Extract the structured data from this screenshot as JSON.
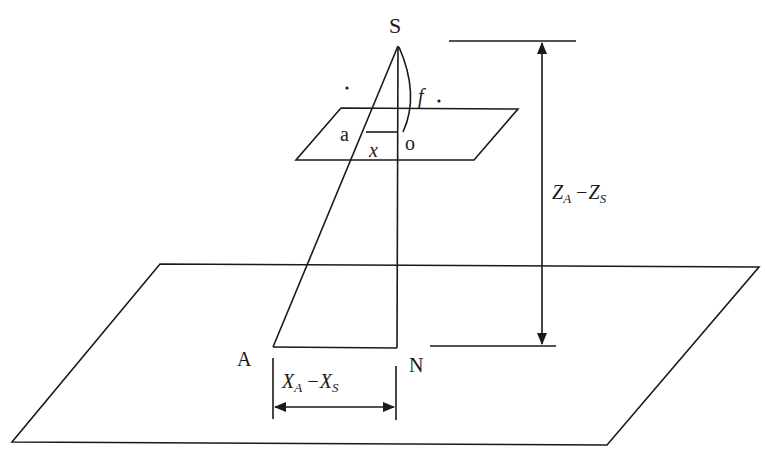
{
  "diagram": {
    "type": "photogrammetry-collinearity",
    "labels": {
      "perspective_center": "S",
      "image_point": "a",
      "principal_point": "o",
      "image_coord": "x",
      "focal_length": "f",
      "ground_point": "A",
      "nadir_point": "N",
      "height_main": "Z",
      "height_sub1": "A",
      "height_minus": "−",
      "height_sub2": "S",
      "width_main": "X",
      "width_sub1": "A",
      "width_minus": "−",
      "width_sub2": "S"
    },
    "dimensions": {
      "vertical": "Z_A − Z_S",
      "horizontal": "X_A − X_S"
    },
    "colors": {
      "stroke": "#1a1a1a",
      "background": "#ffffff"
    }
  }
}
